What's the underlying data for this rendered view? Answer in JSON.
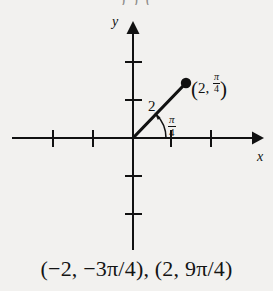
{
  "figure": {
    "type": "polar-coordinate-diagram",
    "background_color": "#f2f1ef",
    "ink_color": "#111111",
    "clipped_top_text": ")  )      (",
    "axes": {
      "x_axis_label": "x",
      "y_axis_label": "y",
      "origin_px": [
        133,
        128
      ],
      "x_ticks_px": [
        53,
        93,
        171,
        211
      ],
      "y_ticks_px": [
        52,
        90,
        166,
        204
      ],
      "unit_px": 40,
      "x_arrow_end_px": 262,
      "y_arrow_end_px": 12
    },
    "ray": {
      "from_px": [
        133,
        128
      ],
      "to_px": [
        186,
        73
      ],
      "radius_label": "2",
      "angle_label_numerator": "π",
      "angle_label_denominator": "4",
      "angle_degrees": 45
    },
    "point": {
      "marker": "filled-dot",
      "position_px": [
        186,
        73
      ],
      "label_r": "2",
      "label_theta_numerator": "π",
      "label_theta_denominator": "4",
      "label_text": "(2, π/4)"
    }
  },
  "caption": {
    "text": "(−2, −3π/4), (2, 9π/4)",
    "first_pair": "(−2, −3π/4)",
    "second_pair": "(2, 9π/4)"
  }
}
